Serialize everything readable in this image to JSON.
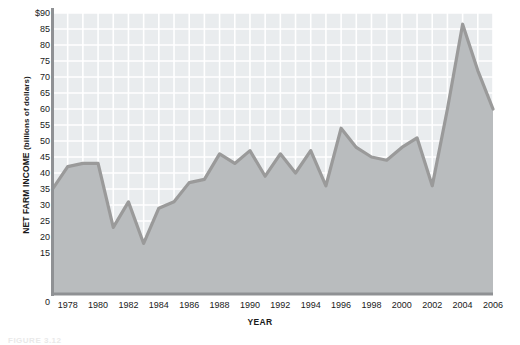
{
  "chart_data": {
    "type": "area",
    "title": "",
    "xlabel": "YEAR",
    "ylabel": "NET FARM INCOME (billions of dollars)",
    "ylabel_main": "NET FARM INCOME",
    "ylabel_sub": "(billions of dollars)",
    "ylim": [
      0,
      90
    ],
    "ytick_labels": [
      "$90",
      "85",
      "80",
      "75",
      "70",
      "65",
      "60",
      "55",
      "50",
      "45",
      "40",
      "35",
      "30",
      "25",
      "20",
      "15",
      "0"
    ],
    "ytick_values": [
      90,
      85,
      80,
      75,
      70,
      65,
      60,
      55,
      50,
      45,
      40,
      35,
      30,
      25,
      20,
      15,
      0
    ],
    "xlim": [
      1977,
      2006
    ],
    "xtick_labels": [
      "1978",
      "1980",
      "1982",
      "1984",
      "1986",
      "1988",
      "1990",
      "1992",
      "1994",
      "1996",
      "1998",
      "2000",
      "2002",
      "2004",
      "2006"
    ],
    "xtick_values": [
      1978,
      1980,
      1982,
      1984,
      1986,
      1988,
      1990,
      1992,
      1994,
      1996,
      1998,
      2000,
      2002,
      2004,
      2006
    ],
    "grid": true,
    "legend": "none",
    "x": [
      1977,
      1978,
      1979,
      1980,
      1981,
      1982,
      1983,
      1984,
      1985,
      1986,
      1987,
      1988,
      1989,
      1990,
      1991,
      1992,
      1993,
      1994,
      1995,
      1996,
      1997,
      1998,
      1999,
      2000,
      2001,
      2002,
      2003,
      2004,
      2005,
      2006
    ],
    "values": [
      35,
      42,
      43,
      43,
      23,
      31,
      18,
      29,
      31,
      37,
      38,
      46,
      43,
      47,
      39,
      46,
      40,
      47,
      36,
      54,
      48,
      45,
      44,
      48,
      51,
      36,
      60,
      86.5,
      72,
      60
    ],
    "series": [
      {
        "name": "Net farm income",
        "values": [
          35,
          42,
          43,
          43,
          23,
          31,
          18,
          29,
          31,
          37,
          38,
          46,
          43,
          47,
          39,
          46,
          40,
          47,
          36,
          54,
          48,
          45,
          44,
          48,
          51,
          36,
          60,
          86.5,
          72,
          60
        ]
      }
    ],
    "colors": {
      "line": "#9a9a9a",
      "fill": "#b9bcbe",
      "plot_background": "#e9ecee",
      "gridline": "#ffffff",
      "axis": "#8f9194",
      "text": "#1a1a1a"
    }
  },
  "caption": {
    "text": "FIGURE 3.12"
  }
}
